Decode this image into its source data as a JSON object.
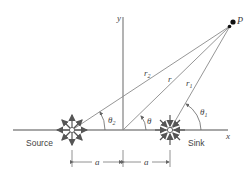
{
  "diagram": {
    "type": "source-sink flow geometry",
    "point_label": "P",
    "axis_x_label": "x",
    "axis_y_label": "y",
    "source_label": "Source",
    "sink_label": "Sink",
    "r_label": "r",
    "r1_label": "r",
    "r1_sub": "1",
    "r2_label": "r",
    "r2_sub": "2",
    "theta_label": "θ",
    "theta1_label": "θ",
    "theta1_sub": "1",
    "theta2_label": "θ",
    "theta2_sub": "2",
    "dim_left_label": "a",
    "dim_right_label": "a",
    "colors": {
      "line": "#8a8a8a",
      "arrow": "#555555",
      "text": "#444444",
      "point": "#111111"
    }
  }
}
